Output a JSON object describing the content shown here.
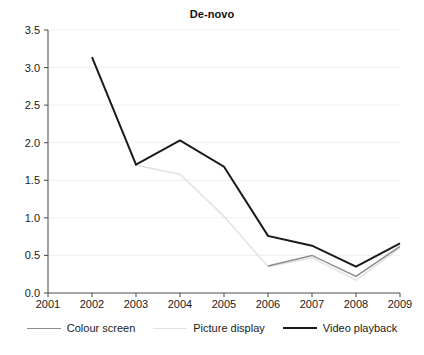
{
  "chart_data": {
    "type": "line",
    "title": "De-novo",
    "xlabel": "",
    "ylabel": "",
    "x": [
      2001,
      2002,
      2003,
      2004,
      2005,
      2006,
      2007,
      2008,
      2009
    ],
    "xtick_labels": [
      "2001",
      "2002",
      "2003",
      "2004",
      "2005",
      "2006",
      "2007",
      "2008",
      "2009"
    ],
    "ytick_labels": [
      "0.0",
      "0.5",
      "1.0",
      "1.5",
      "2.0",
      "2.5",
      "3.0",
      "3.5"
    ],
    "yticks": [
      0.0,
      0.5,
      1.0,
      1.5,
      2.0,
      2.5,
      3.0,
      3.5
    ],
    "ylim": [
      0.0,
      3.5
    ],
    "xlim": [
      2001,
      2009
    ],
    "grid": true,
    "grid_axis": "y",
    "legend_position": "bottom",
    "series": [
      {
        "name": "Colour screen",
        "color": "#8c8c8c",
        "x": [
          2006,
          2007,
          2008,
          2009
        ],
        "values": [
          0.36,
          0.5,
          0.22,
          0.62
        ]
      },
      {
        "name": "Picture display",
        "color": "#e2e2e2",
        "x": [
          2003,
          2004,
          2005,
          2006,
          2007,
          2008,
          2009
        ],
        "values": [
          1.7,
          1.58,
          1.02,
          0.35,
          0.47,
          0.17,
          0.6
        ]
      },
      {
        "name": "Video playback",
        "color": "#1a1a1a",
        "x": [
          2002,
          2003,
          2004,
          2005,
          2006,
          2007,
          2008,
          2009
        ],
        "values": [
          3.14,
          1.71,
          2.03,
          1.68,
          0.76,
          0.63,
          0.35,
          0.66
        ]
      }
    ]
  },
  "legend": {
    "items": [
      {
        "label": "Colour screen"
      },
      {
        "label": "Picture display"
      },
      {
        "label": "Video playback"
      }
    ]
  },
  "axes": {
    "axis_color": "#555555",
    "grid_color": "#f0f0f0"
  }
}
